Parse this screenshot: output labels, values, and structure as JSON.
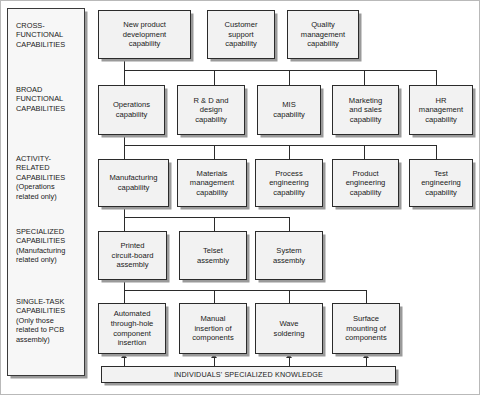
{
  "figure": {
    "bottom_bar_label": "INDIVIDUALS' SPECIALIZED KNOWLEDGE",
    "colors": {
      "box_fill": "#f2f2f2",
      "legend_fill": "#f7f7f7",
      "border": "#2b2b2b",
      "shadow": "#9a9a9a",
      "text": "#1a1a1a",
      "background": "#ffffff"
    }
  },
  "legend": {
    "items": [
      {
        "heading": "CROSS-\nFUNCTIONAL\nCAPABILITIES",
        "line1": "CROSS-",
        "line2": "FUNCTIONAL",
        "line3": "CAPABILITIES",
        "note1": "",
        "note2": ""
      },
      {
        "heading": "BROAD FUNCTIONAL CAPABILITIES",
        "line1": "BROAD",
        "line2": "FUNCTIONAL",
        "line3": "CAPABILITIES",
        "note1": "",
        "note2": ""
      },
      {
        "heading": "ACTIVITY-RELATED CAPABILITIES",
        "line1": "ACTIVITY-",
        "line2": "RELATED",
        "line3": "CAPABILITIES",
        "note1": "(Operations",
        "note2": "related only)"
      },
      {
        "heading": "SPECIALIZED CAPABILITIES",
        "line1": "SPECIALIZED",
        "line2": "CAPABILITIES",
        "line3": "",
        "note1": "(Manufacturing",
        "note2": "related only)"
      },
      {
        "heading": "SINGLE-TASK CAPABILITIES",
        "line1": "SINGLE-TASK",
        "line2": "CAPABILITIES",
        "line3": "",
        "note1": "(Only those",
        "note2": "related to PCB",
        "note3": "assembly)"
      }
    ]
  },
  "rows": {
    "cross_functional": {
      "label": "CROSS-FUNCTIONAL CAPABILITIES",
      "nodes": [
        {
          "id": "new-product-development-capability",
          "lines": [
            "New product",
            "development",
            "capability"
          ]
        },
        {
          "id": "customer-support-capability",
          "lines": [
            "Customer",
            "support",
            "capability"
          ]
        },
        {
          "id": "quality-management-capability",
          "lines": [
            "Quality",
            "management",
            "capability"
          ]
        }
      ]
    },
    "broad_functional": {
      "label": "BROAD FUNCTIONAL CAPABILITIES",
      "nodes": [
        {
          "id": "operations-capability",
          "lines": [
            "Operations",
            "capability"
          ]
        },
        {
          "id": "rd-and-design-capability",
          "lines": [
            "R & D and",
            "design",
            "capability"
          ]
        },
        {
          "id": "mis-capability",
          "lines": [
            "MIS",
            "capability"
          ]
        },
        {
          "id": "marketing-and-sales-capability",
          "lines": [
            "Marketing",
            "and sales",
            "capability"
          ]
        },
        {
          "id": "hr-management-capability",
          "lines": [
            "HR",
            "management",
            "capability"
          ]
        }
      ]
    },
    "activity_related": {
      "label": "ACTIVITY-RELATED CAPABILITIES (Operations related only)",
      "nodes": [
        {
          "id": "manufacturing-capability",
          "lines": [
            "Manufacturing",
            "capability"
          ]
        },
        {
          "id": "materials-management-capability",
          "lines": [
            "Materials",
            "management",
            "capability"
          ]
        },
        {
          "id": "process-engineering-capability",
          "lines": [
            "Process",
            "engineering",
            "capability"
          ]
        },
        {
          "id": "product-engineering-capability",
          "lines": [
            "Product",
            "engineering",
            "capability"
          ]
        },
        {
          "id": "test-engineering-capability",
          "lines": [
            "Test",
            "engineering",
            "capability"
          ]
        }
      ]
    },
    "specialized": {
      "label": "SPECIALIZED CAPABILITIES (Manufacturing related only)",
      "nodes": [
        {
          "id": "printed-circuit-board-assembly",
          "lines": [
            "Printed",
            "circuit-board",
            "assembly"
          ]
        },
        {
          "id": "telset-assembly",
          "lines": [
            "Telset",
            "assembly"
          ]
        },
        {
          "id": "system-assembly",
          "lines": [
            "System",
            "assembly"
          ]
        }
      ]
    },
    "single_task": {
      "label": "SINGLE-TASK CAPABILITIES (Only those related to PCB assembly)",
      "nodes": [
        {
          "id": "automated-through-hole-component-insertion",
          "lines": [
            "Automated",
            "through-hole",
            "component",
            "insertion"
          ]
        },
        {
          "id": "manual-insertion-of-components",
          "lines": [
            "Manual",
            "insertion of",
            "components"
          ]
        },
        {
          "id": "wave-soldering",
          "lines": [
            "Wave",
            "soldering"
          ]
        },
        {
          "id": "surface-mounting-of-components",
          "lines": [
            "Surface",
            "mounting of",
            "components"
          ]
        }
      ]
    }
  }
}
